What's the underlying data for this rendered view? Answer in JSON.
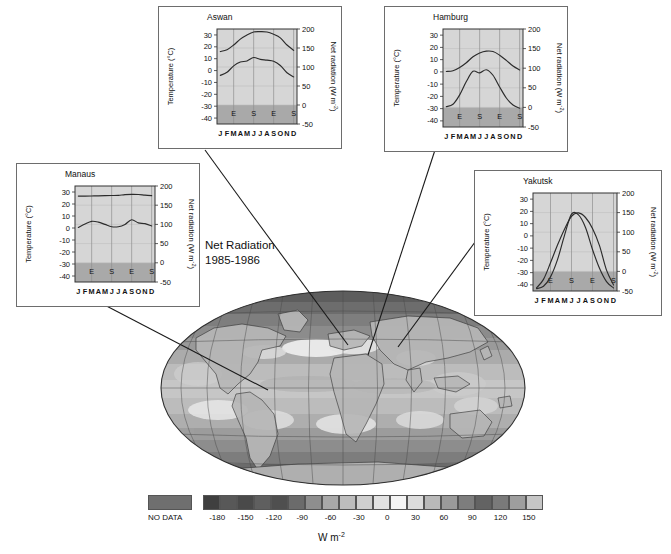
{
  "figure": {
    "caption_line1": "Net Radiation",
    "caption_line2": "1985-1986",
    "units": "W m",
    "units_exp": "-2"
  },
  "legend": {
    "no_data_label": "NO DATA",
    "no_data_color": "#6f6f6f",
    "tick_labels": [
      "-180",
      "-150",
      "-120",
      "-90",
      "-60",
      "-30",
      "0",
      "30",
      "60",
      "90",
      "120",
      "150"
    ],
    "colors": [
      "#3f3f3f",
      "#585858",
      "#4a4a4a",
      "#5f5f5f",
      "#4f4f4f",
      "#6b6b6b",
      "#8e8e8e",
      "#a8a8a8",
      "#bdbdbd",
      "#cfcfcf",
      "#e2e2e2",
      "#f4f4f4",
      "#dcdcdc",
      "#b9b9b9",
      "#9a9a9a",
      "#7d7d7d",
      "#636363",
      "#7a7a7a",
      "#9e9e9e",
      "#c6c6c6"
    ]
  },
  "axis": {
    "temp_label": "Temperature (°C)",
    "rad_label": "Net radiation (W m",
    "rad_label_exp": "-2",
    "rad_label_tail": ")",
    "temp_ticks": [
      "30",
      "20",
      "10",
      "0",
      "-10",
      "-20",
      "-30",
      "-40"
    ],
    "temp_tick_values": [
      30,
      20,
      10,
      0,
      -10,
      -20,
      -30,
      -40
    ],
    "rad_ticks": [
      "200",
      "150",
      "100",
      "50",
      "0",
      "-50"
    ],
    "rad_tick_values": [
      200,
      150,
      100,
      50,
      0,
      -50
    ],
    "months": [
      "J",
      "F",
      "M",
      "A",
      "M",
      "J",
      "J",
      "A",
      "S",
      "O",
      "N",
      "D"
    ],
    "season_marks": [
      {
        "label": "E",
        "month_index": 2
      },
      {
        "label": "S",
        "month_index": 5
      },
      {
        "label": "E",
        "month_index": 8
      },
      {
        "label": "S",
        "month_index": 11
      }
    ],
    "ylim_temp": [
      -45,
      35
    ],
    "ylim_rad": [
      -50,
      200
    ],
    "grid": true
  },
  "chart_data": [
    {
      "type": "line",
      "title": "Aswan",
      "xlabel": "",
      "ylabel": "Temperature (°C)",
      "y2label": "Net radiation (W m-2)",
      "categories": [
        "J",
        "F",
        "M",
        "A",
        "M",
        "J",
        "J",
        "A",
        "S",
        "O",
        "N",
        "D"
      ],
      "ylim": [
        -45,
        35
      ],
      "y2lim": [
        -50,
        200
      ],
      "series": [
        {
          "name": "Temperature",
          "axis": "left",
          "values": [
            16.0,
            17.5,
            21.5,
            26.5,
            30.0,
            32.5,
            32.8,
            32.5,
            30.5,
            27.5,
            21.5,
            17.0
          ]
        },
        {
          "name": "Net radiation",
          "axis": "right",
          "values": [
            78,
            86,
            103,
            113,
            116,
            125,
            120,
            118,
            115,
            104,
            85,
            74
          ]
        }
      ]
    },
    {
      "type": "line",
      "title": "Hamburg",
      "xlabel": "",
      "ylabel": "Temperature (°C)",
      "y2label": "Net radiation (W m-2)",
      "categories": [
        "J",
        "F",
        "M",
        "A",
        "M",
        "J",
        "J",
        "A",
        "S",
        "O",
        "N",
        "D"
      ],
      "ylim": [
        -45,
        35
      ],
      "y2lim": [
        -50,
        200
      ],
      "series": [
        {
          "name": "Temperature",
          "axis": "left",
          "values": [
            0.3,
            0.9,
            3.6,
            7.5,
            12.3,
            15.4,
            16.9,
            16.6,
            13.6,
            9.4,
            4.8,
            1.6
          ]
        },
        {
          "name": "Net radiation",
          "axis": "right",
          "values": [
            2,
            8,
            32,
            66,
            92,
            88,
            96,
            82,
            52,
            24,
            6,
            -2
          ]
        }
      ]
    },
    {
      "type": "line",
      "title": "Manaus",
      "xlabel": "",
      "ylabel": "Temperature (°C)",
      "y2label": "Net radiation (W m-2)",
      "categories": [
        "J",
        "F",
        "M",
        "A",
        "M",
        "J",
        "J",
        "A",
        "S",
        "O",
        "N",
        "D"
      ],
      "ylim": [
        -45,
        35
      ],
      "y2lim": [
        -50,
        200
      ],
      "series": [
        {
          "name": "Temperature",
          "axis": "left",
          "values": [
            26.6,
            26.6,
            26.7,
            26.8,
            27.0,
            27.1,
            27.2,
            27.8,
            28.0,
            27.9,
            27.4,
            27.0
          ]
        },
        {
          "name": "Net radiation",
          "axis": "right",
          "values": [
            92,
            101,
            108,
            106,
            100,
            94,
            94,
            100,
            112,
            104,
            102,
            96
          ]
        }
      ]
    },
    {
      "type": "line",
      "title": "Yakutsk",
      "xlabel": "",
      "ylabel": "Temperature (°C)",
      "y2label": "Net radiation (W m-2)",
      "categories": [
        "J",
        "F",
        "M",
        "A",
        "M",
        "J",
        "J",
        "A",
        "S",
        "O",
        "N",
        "D"
      ],
      "ylim": [
        -45,
        35
      ],
      "y2lim": [
        -50,
        200
      ],
      "series": [
        {
          "name": "Temperature",
          "axis": "left",
          "values": [
            -42.5,
            -35.5,
            -22.0,
            -7.5,
            5.5,
            16.0,
            18.8,
            15.0,
            6.0,
            -8.0,
            -28.0,
            -40.0
          ]
        },
        {
          "name": "Net radiation",
          "axis": "right",
          "values": [
            -44,
            -38,
            -14,
            30,
            92,
            146,
            144,
            112,
            56,
            8,
            -26,
            -42
          ]
        }
      ]
    }
  ],
  "panels": [
    {
      "name": "aswan",
      "title": "Aswan"
    },
    {
      "name": "hamburg",
      "title": "Hamburg"
    },
    {
      "name": "manaus",
      "title": "Manaus"
    },
    {
      "name": "yakutsk",
      "title": "Yakutsk"
    }
  ]
}
